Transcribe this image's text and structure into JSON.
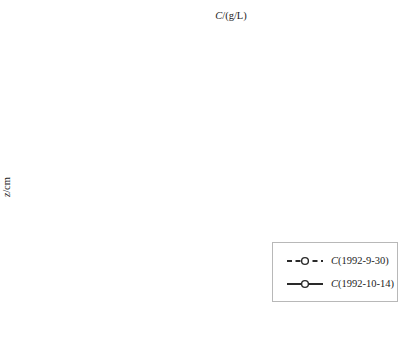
{
  "figure": {
    "x_axis_title": {
      "var": "C",
      "rest": "/(g/L)"
    },
    "y_axis_title": {
      "var": "z",
      "rest": "/cm"
    }
  },
  "chart_data": {
    "type": "line",
    "title": "",
    "xlabel": "C/(g/L)",
    "ylabel": "z/cm",
    "xlim": [
      0,
      2
    ],
    "ylim": [
      -250,
      0
    ],
    "x_tick_labels": [
      "0",
      "0.2",
      "0.4",
      "0.6",
      "0.8",
      "1",
      "1.2",
      "1.4",
      "1.6",
      "1.8",
      "2"
    ],
    "y_tick_labels": [
      "-10",
      "-30",
      "-50",
      "-70",
      "-90",
      "-110",
      "-130",
      "-150",
      "-170",
      "-190",
      "-210",
      "-230",
      "-250"
    ],
    "grid": true,
    "legend_position": "inside-bottom-right",
    "depths_cm": [
      -5,
      -10,
      -20,
      -30,
      -50,
      -70,
      -80,
      -90,
      -110,
      -130,
      -150,
      -170,
      -190,
      -210,
      -230,
      -250
    ],
    "series": [
      {
        "name": "C(1992-9-30)",
        "line_style": "dashed",
        "marker": "open-circle",
        "values": [
          1.75,
          1.3,
          0.95,
          0.85,
          0.72,
          0.58,
          0.55,
          0.5,
          0.5,
          0.5,
          0.5,
          0.46,
          0.37,
          0.32,
          0.3,
          0.3
        ],
        "point_labels": [
          "1.75",
          "1.3",
          "0.95",
          "0.85",
          "0.72",
          "0.58",
          "0.55",
          "0.5",
          "0.5",
          "0.5",
          "0.5",
          "0.46",
          "0.37",
          "0.32",
          "0.3",
          "0.3"
        ],
        "label_side": [
          "right",
          "below",
          "right",
          "right",
          "right",
          "right",
          "right",
          "right",
          "right",
          "right",
          "right",
          "right",
          "right",
          "right",
          "right",
          "right"
        ]
      },
      {
        "name": "C(1992-10-14)",
        "line_style": "solid",
        "marker": "open-circle",
        "values": [
          0.34,
          0.42,
          0.46,
          0.46,
          0.44,
          0.4,
          0.4,
          0.39,
          0.4,
          0.42,
          0.44,
          0.41,
          0.35,
          0.3,
          0.29,
          0.26
        ],
        "point_labels": [
          "0.34",
          "0.42",
          "0.46",
          "0.46",
          "0.44",
          "0.4",
          "0.4",
          "0.39",
          "0.4",
          "0.42",
          "0.44",
          "0.41",
          "0.35",
          "0.3",
          "0.29",
          "0.26"
        ],
        "label_side": [
          "left",
          "left",
          "left",
          "left",
          "left",
          "left",
          "left",
          "left",
          "left",
          "left",
          "left",
          "left",
          "left",
          "left",
          "left",
          "left"
        ]
      }
    ],
    "colors": {
      "line": "#2a2a2a",
      "grid": "#ededed",
      "axis": "#1a1a1a",
      "text": "#1c1c1c",
      "marker_fill": "#ffffff"
    }
  },
  "legend": {
    "items": [
      {
        "var": "C",
        "text": "(1992-9-30)"
      },
      {
        "var": "C",
        "text": "(1992-10-14)"
      }
    ]
  }
}
